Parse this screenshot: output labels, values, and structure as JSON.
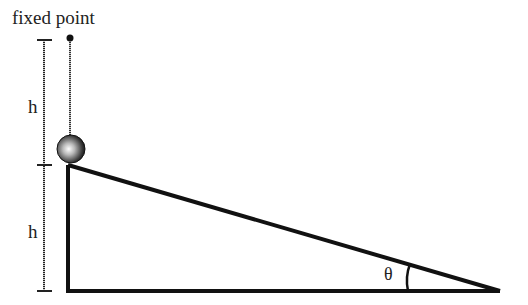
{
  "diagram": {
    "title_label": "fixed point",
    "height_label_top": "h",
    "height_label_bottom": "h",
    "angle_label": "θ",
    "colors": {
      "line": "#111111",
      "ball_highlight": "#ffffff",
      "ball_shadow": "#222222",
      "background": "#ffffff"
    },
    "elements": {
      "fixed_point": {
        "x": 70,
        "y": 38
      },
      "ball": {
        "cx": 71,
        "cy": 149,
        "r": 14
      },
      "incline": {
        "top": [
          68,
          165
        ],
        "corner": [
          68,
          291
        ],
        "tip": [
          500,
          291
        ]
      },
      "dimension": {
        "x": 44,
        "top": 40,
        "middle": 165,
        "bottom": 291
      }
    }
  }
}
